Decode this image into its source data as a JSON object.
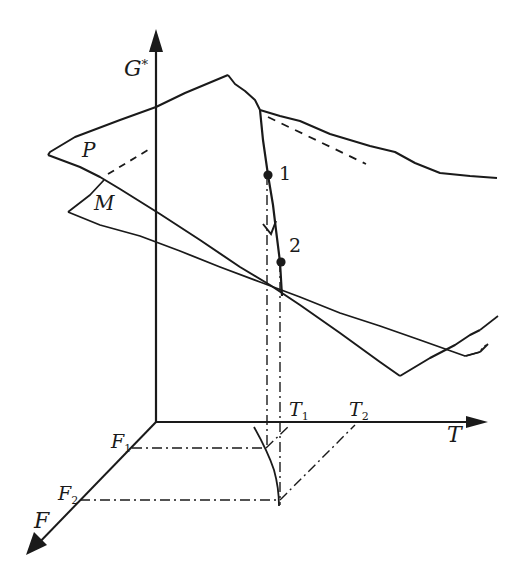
{
  "diagram": {
    "type": "3d-phase-surface",
    "axes": {
      "vertical": {
        "label": "G",
        "superscript": "*"
      },
      "horizontal": {
        "label": "T"
      },
      "depth": {
        "label": "F"
      }
    },
    "surfaces": [
      {
        "label": "P"
      },
      {
        "label": "M"
      }
    ],
    "points": [
      {
        "label": "1"
      },
      {
        "label": "2"
      }
    ],
    "t_ticks": [
      {
        "base": "T",
        "sub": "1"
      },
      {
        "base": "T",
        "sub": "2"
      }
    ],
    "f_ticks": [
      {
        "base": "F",
        "sub": "1"
      },
      {
        "base": "F",
        "sub": "2"
      }
    ],
    "colors": {
      "ink": "#1a1a1a",
      "background": "#ffffff"
    }
  }
}
